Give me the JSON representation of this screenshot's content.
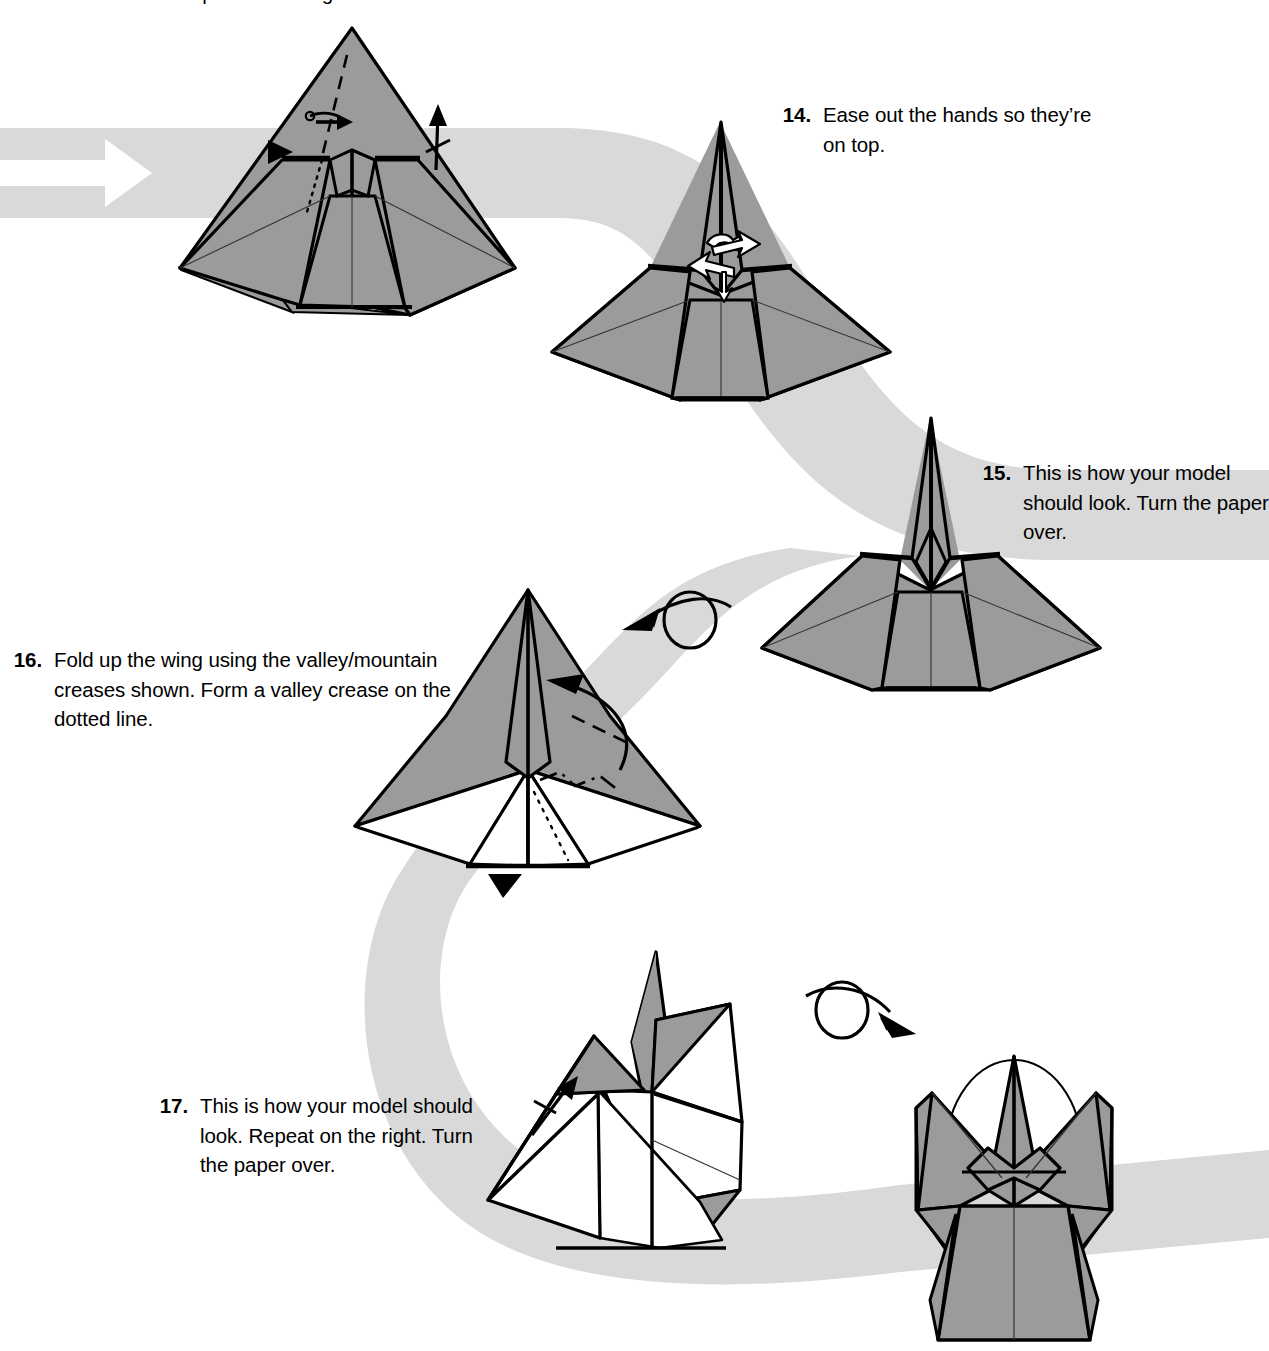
{
  "page": {
    "width": 1269,
    "height": 1351,
    "background": "#ffffff"
  },
  "colors": {
    "paper_gray": "#9b9b9b",
    "paper_gray_dark": "#8d8d8d",
    "paper_white": "#ffffff",
    "ribbon_gray": "#d9d9d9",
    "ink_black": "#000000",
    "arrow_white": "#ffffff"
  },
  "truncated_caption": {
    "text": "Repeat on the right."
  },
  "steps": [
    {
      "number": "14.",
      "text": "Ease out the hands so they’re on top.",
      "lines": [
        "Ease out the hands so",
        "they’re on top."
      ]
    },
    {
      "number": "15.",
      "text": "This is how your model should look. Turn the paper over.",
      "lines": [
        "This is how your",
        "model should look.",
        "Turn the paper over."
      ]
    },
    {
      "number": "16.",
      "text": "Fold up the wing using the valley/mountain creases shown. Form a valley crease on the dotted line.",
      "lines": [
        "Fold up the wing using the valley/",
        "mountain creases shown. Form a",
        "valley crease on the dotted line."
      ]
    },
    {
      "number": "17.",
      "text": "This is how your model should look. Repeat on the right. Turn the paper over.",
      "lines": [
        "This is how your model",
        "should look. Repeat on",
        "the right. Turn the paper",
        "over."
      ]
    }
  ],
  "diagram_symbols": [
    {
      "name": "flow-ribbon",
      "label": "gray S-curve flow ribbon connecting the steps"
    },
    {
      "name": "white-flow-arrow",
      "label": "white arrow inside the ribbon at the left edge pointing right"
    },
    {
      "name": "repeat-arrow-step13",
      "label": "repeat-once arrow (arrow with one tick) beside the first model"
    },
    {
      "name": "push-in-triangle",
      "label": "solid black triangle push marker on the first model"
    },
    {
      "name": "valley-fold-dashed",
      "label": "dashed valley crease line"
    },
    {
      "name": "hidden-edge-dotted",
      "label": "dotted hidden edge line"
    },
    {
      "name": "mountain-fold-dashdot",
      "label": "dash-dot mountain crease line"
    },
    {
      "name": "ease-out-white-arrows",
      "label": "pair of hollow white arrows showing the ease-out motion"
    },
    {
      "name": "turn-over-arrow-left",
      "label": "loop turn-over arrow pointing left, between step 15 and 16"
    },
    {
      "name": "turn-over-arrow-right",
      "label": "loop turn-over arrow pointing right, between step 17 and the final model"
    },
    {
      "name": "fold-up-curved-arrow",
      "label": "curved arrow showing the wing folding up"
    },
    {
      "name": "repeat-arrow-step17",
      "label": "repeat-once arrow beside the step 17 model"
    },
    {
      "name": "halo-circle",
      "label": "thin circle outline (halo) behind the finished angel model"
    }
  ],
  "figures": [
    {
      "name": "model-step13-result",
      "caption_ref": "Repeat on the right."
    },
    {
      "name": "model-step14",
      "caption_ref": "14."
    },
    {
      "name": "model-step15",
      "caption_ref": "15."
    },
    {
      "name": "model-step16",
      "caption_ref": "16."
    },
    {
      "name": "model-step17",
      "caption_ref": "17."
    },
    {
      "name": "model-finished-angel",
      "caption_ref": ""
    }
  ]
}
